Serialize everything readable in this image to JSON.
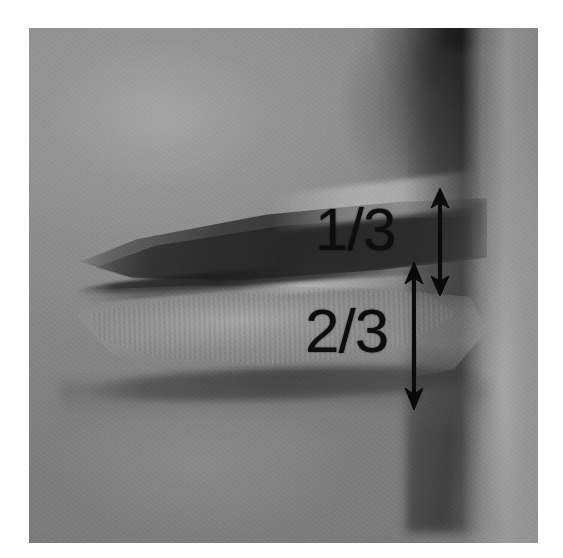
{
  "figure": {
    "modality": "clinical photograph",
    "color_mode": "grayscale",
    "border_color": "#ffffff",
    "plate": {
      "background_color": "#8b8b8b",
      "shadow_color": "#141414",
      "highlight_color": "#b4b4b4"
    }
  },
  "annotations": {
    "color": "#0d0d0d",
    "items": [
      {
        "id": "upper-third",
        "label": "1/3",
        "region": "upper lip vermilion",
        "arrow": "double-headed-vertical",
        "arrow_length_px": 70
      },
      {
        "id": "lower-thirds",
        "label": "2/3",
        "region": "lower lip vermilion",
        "arrow": "double-headed-vertical",
        "arrow_length_px": 112
      }
    ]
  },
  "anatomy": {
    "features": [
      "upper lip",
      "lower lip",
      "oral commissure",
      "vermilion border",
      "labiomental sulcus",
      "nasolabial fold shadow",
      "chin",
      "cheek"
    ]
  }
}
